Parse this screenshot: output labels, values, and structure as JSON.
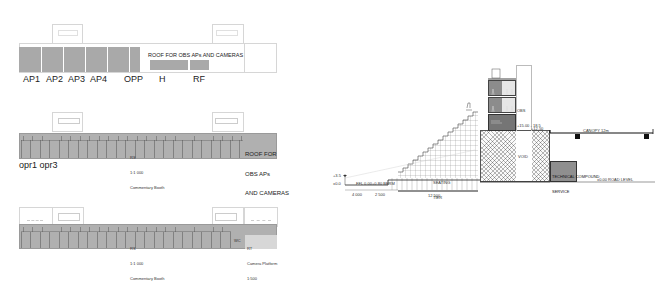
{
  "plan_top": {
    "bays": [
      "AP1",
      "AP2",
      "AP3",
      "AP4",
      "OPP"
    ],
    "roof_note": "ROOF FOR OBS APs AND CAMERAS",
    "lower_blocks": [
      "H",
      "RF"
    ]
  },
  "plan_middle": {
    "roof_note_lines": [
      "ROOF FOR",
      "OBS APs",
      "AND CAMERAS"
    ],
    "center_note_lines": [
      "RS",
      "1:1 000",
      "Commentary Booth"
    ],
    "bottom_labels": "opr1 opr3"
  },
  "plan_bottom": {
    "center_note_lines": [
      "RS",
      "1:1 000",
      "Commentary Booth"
    ],
    "end_note_lines": [
      "RT",
      "Camera Platform",
      "1:500"
    ],
    "small_tag": "WC"
  },
  "section": {
    "level_labels": [
      "+3.5",
      "±0.0"
    ],
    "dim_bottom": [
      "4 000",
      "2 500",
      "12 500"
    ],
    "ground_labels": [
      "FFL 0.00",
      "+0.80 BERM"
    ],
    "stand_note": [
      "SEATING",
      "TIER"
    ],
    "tower_label": [
      "OBS",
      "+15.00 - 18.5"
    ],
    "core_label": "VOID",
    "roof_level": "+12.50",
    "canopy_label": "CANOPY 12m",
    "podium_label": [
      "TECHNICAL COMPOUND",
      "SERVICE"
    ],
    "road_label": "±0.00 ROAD LEVEL"
  },
  "colors": {
    "block_gray": "#a9a9a9",
    "band_gray": "#b0b0b0",
    "line_dark": "#222222",
    "line_light": "#d6d6d6",
    "tower_gray": "#7a7a7a"
  }
}
